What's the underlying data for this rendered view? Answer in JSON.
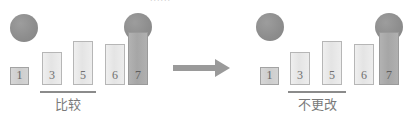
{
  "diagram": {
    "title_clipped": "......",
    "type": "algorithm-step-comparison",
    "arrow": {
      "name": "transition-arrow",
      "direction": "right"
    },
    "panels": [
      {
        "id": "before",
        "caption": "比较",
        "bars": [
          {
            "label": "1",
            "height": 18,
            "style": "small"
          },
          {
            "label": "3",
            "height": 33,
            "style": "light"
          },
          {
            "label": "5",
            "height": 44,
            "style": "light"
          },
          {
            "label": "6",
            "height": 41,
            "style": "light"
          },
          {
            "label": "7",
            "height": 53,
            "style": "dark"
          }
        ],
        "markers": [
          {
            "name": "pointer-circle-left",
            "over": "left-of-bar-1"
          },
          {
            "name": "pointer-circle-right",
            "over": "bar-7"
          }
        ],
        "underline_spans": [
          "3",
          "5"
        ]
      },
      {
        "id": "after",
        "caption": "不更改",
        "bars": [
          {
            "label": "1",
            "height": 18,
            "style": "small"
          },
          {
            "label": "3",
            "height": 33,
            "style": "light"
          },
          {
            "label": "5",
            "height": 44,
            "style": "light"
          },
          {
            "label": "6",
            "height": 41,
            "style": "light"
          },
          {
            "label": "7",
            "height": 53,
            "style": "dark"
          }
        ],
        "markers": [
          {
            "name": "pointer-circle-left",
            "over": "bar-1"
          },
          {
            "name": "pointer-circle-right",
            "over": "bar-7"
          }
        ],
        "underline_spans": [
          "3",
          "5"
        ]
      }
    ]
  },
  "colors": {
    "bar_fill": "#e8e8e8",
    "bar_border": "#b6b6b6",
    "bar_dark_fill": "#a8a8a8",
    "circle_fill": "#8e8e8e",
    "underline": "#8b8b8b",
    "caption_text": "#7a7a7a",
    "arrow": "#949494",
    "background": "#ffffff"
  }
}
